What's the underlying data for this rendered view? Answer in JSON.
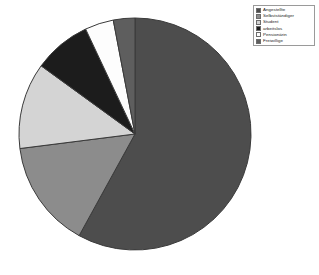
{
  "chart_data": {
    "type": "pie",
    "title": "",
    "subtitle": "",
    "xlabel": "",
    "ylabel": "",
    "legend_position": "top-right",
    "grid": false,
    "start_angle_deg": 0,
    "direction": "clockwise",
    "categories": [
      "Angestellte",
      "Selbstständiger",
      "Student",
      "arbeitslos",
      "Pensionärin",
      "Freiwillige"
    ],
    "values": [
      58,
      15,
      12,
      8,
      4,
      3
    ],
    "units": "percent",
    "colors": [
      "#4d4d4d",
      "#8c8c8c",
      "#d4d4d4",
      "#1c1c1c",
      "#fdfdfd",
      "#5e5e5e"
    ],
    "slices": [
      {
        "label": "Angestellte",
        "value": 58,
        "color": "#4d4d4d"
      },
      {
        "label": "Selbstständiger",
        "value": 15,
        "color": "#8c8c8c"
      },
      {
        "label": "Student",
        "value": 12,
        "color": "#d4d4d4"
      },
      {
        "label": "arbeitslos",
        "value": 8,
        "color": "#1c1c1c"
      },
      {
        "label": "Pensionärin",
        "value": 4,
        "color": "#fdfdfd"
      },
      {
        "label": "Freiwillige",
        "value": 3,
        "color": "#5e5e5e"
      }
    ]
  },
  "legend": {
    "items": [
      {
        "label": "Angestellte",
        "color": "#4d4d4d"
      },
      {
        "label": "Selbstständiger",
        "color": "#8c8c8c"
      },
      {
        "label": "Student",
        "color": "#d4d4d4"
      },
      {
        "label": "arbeitslos",
        "color": "#1c1c1c"
      },
      {
        "label": "Pensionärin",
        "color": "#fdfdfd"
      },
      {
        "label": "Freiwillige",
        "color": "#5e5e5e"
      }
    ]
  },
  "geometry": {
    "center_x": 135,
    "center_y": 134,
    "radius": 116,
    "outline_color": "#3a3a3a"
  }
}
